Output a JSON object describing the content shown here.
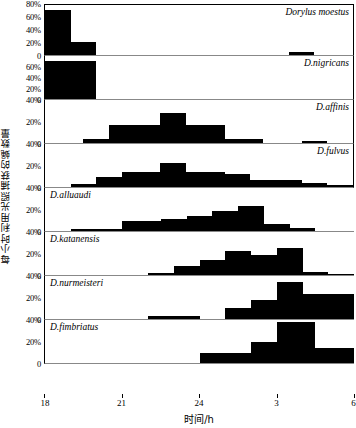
{
  "chart_data": {
    "type": "bar",
    "title": "",
    "xlabel": "时间/h",
    "ylabel": "每小时利用光照捕获的蝇数量",
    "xlim": [
      18,
      30
    ],
    "grid": false,
    "legend_position": "none",
    "x_tick_labels": [
      "18",
      "21",
      "24",
      "3",
      "6"
    ],
    "x_tick_values": [
      18,
      21,
      24,
      27,
      30
    ],
    "bin_count": 24,
    "bin_width_hours": 0.5,
    "panels": [
      {
        "species": "Dorylus moestus",
        "label_align": "right",
        "ylim": [
          0,
          80
        ],
        "y_tick_labels": [
          "80%",
          "60%",
          "40%",
          "20%",
          "0"
        ],
        "y_tick_values": [
          80,
          60,
          40,
          20,
          0
        ],
        "values": [
          70,
          70,
          20,
          20,
          0,
          0,
          0,
          0,
          0,
          0,
          0,
          0,
          0,
          0,
          0,
          0,
          0,
          0,
          0,
          4,
          4,
          0,
          0,
          0
        ]
      },
      {
        "species": "D.nigricans",
        "label_align": "right",
        "ylim": [
          0,
          80
        ],
        "y_tick_labels": [
          "60%",
          "40%",
          "20%",
          "0"
        ],
        "y_tick_values": [
          60,
          40,
          20,
          0
        ],
        "values": [
          70,
          70,
          70,
          70,
          0,
          0,
          0,
          0,
          0,
          0,
          0,
          0,
          0,
          0,
          0,
          0,
          0,
          0,
          0,
          0,
          0,
          0,
          0,
          0
        ]
      },
      {
        "species": "D.affinis",
        "label_align": "right",
        "ylim": [
          0,
          40
        ],
        "y_tick_labels": [
          "40%",
          "20%",
          "0"
        ],
        "y_tick_values": [
          40,
          20,
          0
        ],
        "values": [
          0,
          0,
          0,
          4,
          4,
          16,
          16,
          16,
          16,
          27,
          27,
          16,
          16,
          16,
          4,
          4,
          4,
          0,
          0,
          0,
          2,
          2,
          0,
          0
        ]
      },
      {
        "species": "D.fulvus",
        "label_align": "right",
        "ylim": [
          0,
          40
        ],
        "y_tick_labels": [
          "40%",
          "20%",
          "0"
        ],
        "y_tick_values": [
          40,
          20,
          0
        ],
        "values": [
          0,
          0,
          3,
          3,
          9,
          9,
          14,
          14,
          14,
          22,
          22,
          14,
          14,
          14,
          12,
          12,
          6,
          6,
          6,
          6,
          4,
          4,
          2,
          2
        ]
      },
      {
        "species": "D.alluaudi",
        "label_align": "left",
        "ylim": [
          0,
          40
        ],
        "y_tick_labels": [
          "40%",
          "20%",
          "0"
        ],
        "y_tick_values": [
          40,
          20,
          0
        ],
        "values": [
          0,
          0,
          2,
          2,
          2,
          2,
          9,
          9,
          9,
          11,
          11,
          14,
          14,
          18,
          18,
          23,
          23,
          6,
          6,
          3,
          3,
          0,
          0,
          0
        ]
      },
      {
        "species": "D.katanensis",
        "label_align": "left",
        "ylim": [
          0,
          40
        ],
        "y_tick_labels": [
          "40%",
          "20%",
          "0"
        ],
        "y_tick_values": [
          40,
          20,
          0
        ],
        "values": [
          0,
          0,
          0,
          0,
          0,
          0,
          0,
          0,
          2,
          2,
          8,
          8,
          14,
          14,
          22,
          22,
          18,
          18,
          25,
          25,
          3,
          3,
          1,
          1
        ]
      },
      {
        "species": "D.nurmeisteri",
        "label_align": "left",
        "ylim": [
          0,
          40
        ],
        "y_tick_labels": [
          "40%",
          "20%",
          "0"
        ],
        "y_tick_values": [
          40,
          20,
          0
        ],
        "values": [
          0,
          0,
          0,
          0,
          0,
          0,
          0,
          0,
          3,
          3,
          3,
          3,
          0,
          0,
          10,
          10,
          17,
          17,
          34,
          34,
          23,
          23,
          23,
          23
        ]
      },
      {
        "species": "D.fimbriatus",
        "label_align": "left",
        "ylim": [
          0,
          40
        ],
        "y_tick_labels": [
          "40%",
          "20%",
          "0"
        ],
        "y_tick_values": [
          40,
          20,
          0
        ],
        "values": [
          0,
          0,
          0,
          0,
          0,
          0,
          0,
          0,
          0,
          0,
          0,
          0,
          9,
          9,
          9,
          9,
          19,
          19,
          37,
          37,
          37,
          14,
          14,
          14
        ]
      }
    ]
  }
}
